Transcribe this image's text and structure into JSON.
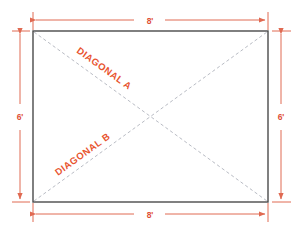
{
  "diagram": {
    "shape": {
      "name": "rectangle",
      "width_label": "8'",
      "height_label": "6'",
      "width_value": 8,
      "height_value": 6,
      "units": "feet"
    },
    "dimensions": [
      {
        "id": "top",
        "label": "8'",
        "orientation": "horizontal",
        "position": "top"
      },
      {
        "id": "bottom",
        "label": "8'",
        "orientation": "horizontal",
        "position": "bottom"
      },
      {
        "id": "left",
        "label": "6'",
        "orientation": "vertical",
        "position": "left"
      },
      {
        "id": "right",
        "label": "6'",
        "orientation": "vertical",
        "position": "right"
      }
    ],
    "diagonals": [
      {
        "id": "a",
        "label": "DIAGONAL A",
        "from": "top-left",
        "to": "bottom-right",
        "style": "dashed"
      },
      {
        "id": "b",
        "label": "DIAGONAL B",
        "from": "bottom-left",
        "to": "top-right",
        "style": "dashed"
      }
    ],
    "colors": {
      "dimension_line": "#e06a52",
      "dimension_text": "#e05038",
      "diagonal_label": "#e8542f",
      "diagonal_line": "#b9bcc4",
      "rectangle_border": "#4a4a4a",
      "background": "#ffffff"
    }
  }
}
